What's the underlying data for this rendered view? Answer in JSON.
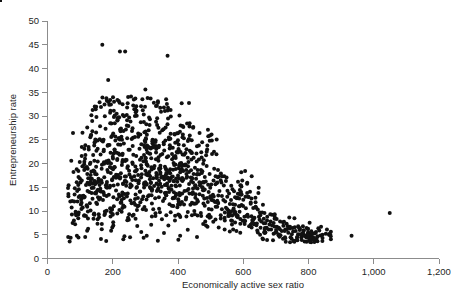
{
  "chart_data": {
    "type": "scatter",
    "title": "",
    "xlabel": "Economically active sex ratio",
    "ylabel": "Entrepreneurship rate",
    "xlim": [
      0,
      1200
    ],
    "ylim": [
      0,
      50
    ],
    "xticks": [
      0,
      200,
      400,
      600,
      800,
      1000,
      1200
    ],
    "xtick_labels": [
      "0",
      "200",
      "400",
      "600",
      "800",
      "1,000",
      "1,200"
    ],
    "yticks": [
      0,
      5,
      10,
      15,
      20,
      25,
      30,
      35,
      40,
      45,
      50
    ],
    "ytick_labels": [
      "0",
      "5",
      "10",
      "15",
      "20",
      "25",
      "30",
      "35",
      "40",
      "45",
      "50"
    ],
    "grid": false,
    "legend": false,
    "marker": "circle",
    "marker_color": "#111111",
    "marker_size": 2.0,
    "n_points": 1180,
    "outliers": [
      {
        "x": 168,
        "y": 45.0
      },
      {
        "x": 222,
        "y": 43.6
      },
      {
        "x": 238,
        "y": 43.6
      },
      {
        "x": 368,
        "y": 42.7
      },
      {
        "x": 186,
        "y": 37.6
      },
      {
        "x": 222,
        "y": 36.9
      },
      {
        "x": 300,
        "y": 35.6
      },
      {
        "x": 1049,
        "y": 9.6
      },
      {
        "x": 932,
        "y": 4.8
      },
      {
        "x": 597,
        "y": 16.4
      },
      {
        "x": 498,
        "y": 25.9
      }
    ],
    "points": [
      [
        64,
        13.6
      ],
      [
        70,
        12.0
      ],
      [
        77,
        7.5
      ],
      [
        82,
        12.0
      ],
      [
        92,
        12.0
      ],
      [
        96,
        14.6
      ],
      [
        101,
        16.0
      ],
      [
        104,
        10.4
      ],
      [
        107,
        19.4
      ],
      [
        110,
        13.2
      ],
      [
        112,
        9.0
      ],
      [
        115,
        21.0
      ],
      [
        118,
        15.5
      ],
      [
        120,
        11.2
      ],
      [
        122,
        17.8
      ],
      [
        124,
        8.4
      ],
      [
        126,
        23.5
      ],
      [
        128,
        14.0
      ],
      [
        130,
        19.9
      ],
      [
        132,
        10.1
      ],
      [
        134,
        26.0
      ],
      [
        136,
        16.8
      ],
      [
        138,
        12.6
      ],
      [
        140,
        21.8
      ],
      [
        142,
        9.3
      ],
      [
        144,
        18.3
      ],
      [
        146,
        24.6
      ],
      [
        148,
        13.9
      ],
      [
        150,
        29.8
      ],
      [
        152,
        11.5
      ],
      [
        154,
        20.4
      ],
      [
        156,
        16.2
      ],
      [
        158,
        8.7
      ],
      [
        160,
        25.1
      ],
      [
        162,
        14.7
      ],
      [
        164,
        31.9
      ],
      [
        166,
        18.9
      ],
      [
        168,
        45.0
      ],
      [
        170,
        12.3
      ],
      [
        172,
        22.6
      ],
      [
        174,
        17.1
      ],
      [
        176,
        9.9
      ],
      [
        178,
        27.3
      ],
      [
        180,
        15.0
      ],
      [
        182,
        33.2
      ],
      [
        184,
        20.1
      ],
      [
        186,
        37.6
      ],
      [
        188,
        13.4
      ],
      [
        190,
        23.9
      ],
      [
        192,
        10.6
      ],
      [
        194,
        18.0
      ],
      [
        196,
        28.4
      ],
      [
        198,
        16.5
      ],
      [
        200,
        21.4
      ],
      [
        202,
        12.9
      ],
      [
        204,
        33.0
      ],
      [
        206,
        19.2
      ],
      [
        208,
        25.7
      ],
      [
        210,
        14.3
      ],
      [
        212,
        30.5
      ],
      [
        214,
        9.5
      ],
      [
        216,
        17.6
      ],
      [
        218,
        22.1
      ],
      [
        220,
        13.0
      ],
      [
        222,
        43.6
      ],
      [
        224,
        26.8
      ],
      [
        226,
        11.8
      ],
      [
        228,
        19.7
      ],
      [
        230,
        32.5
      ],
      [
        232,
        15.8
      ],
      [
        234,
        24.2
      ],
      [
        236,
        10.9
      ],
      [
        238,
        43.6
      ],
      [
        240,
        20.8
      ],
      [
        242,
        16.1
      ],
      [
        244,
        29.1
      ],
      [
        246,
        13.7
      ],
      [
        248,
        27.9
      ],
      [
        250,
        18.5
      ],
      [
        252,
        22.9
      ],
      [
        254,
        12.2
      ],
      [
        256,
        34.1
      ],
      [
        258,
        15.3
      ],
      [
        260,
        20.2
      ],
      [
        262,
        25.4
      ],
      [
        264,
        9.2
      ],
      [
        266,
        17.3
      ],
      [
        268,
        30.0
      ],
      [
        270,
        13.5
      ],
      [
        272,
        21.6
      ],
      [
        274,
        18.7
      ],
      [
        276,
        11.0
      ],
      [
        278,
        26.3
      ],
      [
        280,
        16.4
      ],
      [
        282,
        23.1
      ],
      [
        284,
        14.1
      ],
      [
        286,
        28.7
      ],
      [
        288,
        19.0
      ],
      [
        290,
        12.5
      ],
      [
        292,
        31.2
      ],
      [
        294,
        20.5
      ],
      [
        296,
        15.6
      ],
      [
        298,
        24.8
      ],
      [
        300,
        35.6
      ],
      [
        302,
        10.2
      ],
      [
        304,
        17.9
      ],
      [
        306,
        22.3
      ],
      [
        308,
        13.1
      ],
      [
        310,
        27.0
      ],
      [
        312,
        18.2
      ],
      [
        314,
        29.3
      ],
      [
        316,
        14.8
      ],
      [
        318,
        21.1
      ],
      [
        320,
        11.6
      ],
      [
        322,
        25.0
      ],
      [
        324,
        16.9
      ],
      [
        326,
        32.8
      ],
      [
        328,
        19.5
      ],
      [
        330,
        12.7
      ],
      [
        332,
        23.7
      ],
      [
        334,
        17.4
      ],
      [
        336,
        28.1
      ],
      [
        338,
        14.4
      ],
      [
        340,
        20.6
      ],
      [
        342,
        10.5
      ],
      [
        344,
        26.5
      ],
      [
        346,
        18.1
      ],
      [
        348,
        30.9
      ],
      [
        350,
        15.1
      ],
      [
        352,
        22.0
      ],
      [
        354,
        12.1
      ],
      [
        356,
        24.4
      ],
      [
        358,
        16.7
      ],
      [
        360,
        19.3
      ],
      [
        362,
        27.6
      ],
      [
        364,
        13.3
      ],
      [
        366,
        21.3
      ],
      [
        368,
        42.7
      ],
      [
        370,
        17.0
      ],
      [
        372,
        25.5
      ],
      [
        374,
        11.4
      ],
      [
        376,
        18.8
      ],
      [
        378,
        29.9
      ],
      [
        380,
        14.5
      ],
      [
        382,
        20.9
      ],
      [
        384,
        23.3
      ],
      [
        386,
        16.3
      ],
      [
        388,
        12.8
      ],
      [
        390,
        26.1
      ],
      [
        392,
        19.8
      ],
      [
        394,
        15.2
      ],
      [
        396,
        22.4
      ],
      [
        398,
        10.8
      ],
      [
        400,
        17.5
      ],
      [
        402,
        24.0
      ],
      [
        404,
        13.8
      ],
      [
        406,
        20.0
      ],
      [
        408,
        28.0
      ],
      [
        410,
        16.6
      ],
      [
        412,
        11.9
      ],
      [
        414,
        21.9
      ],
      [
        416,
        18.4
      ],
      [
        418,
        25.3
      ],
      [
        420,
        14.2
      ],
      [
        422,
        19.6
      ],
      [
        424,
        12.4
      ],
      [
        426,
        23.0
      ],
      [
        428,
        17.2
      ],
      [
        430,
        9.8
      ],
      [
        432,
        20.3
      ],
      [
        434,
        15.7
      ],
      [
        436,
        22.7
      ],
      [
        438,
        11.3
      ],
      [
        440,
        18.6
      ],
      [
        442,
        24.9
      ],
      [
        444,
        13.6
      ],
      [
        446,
        16.0
      ],
      [
        448,
        21.2
      ],
      [
        450,
        10.0
      ],
      [
        452,
        19.1
      ],
      [
        455,
        14.9
      ],
      [
        458,
        17.7
      ],
      [
        461,
        12.0
      ],
      [
        464,
        23.8
      ],
      [
        467,
        15.4
      ],
      [
        470,
        9.6
      ],
      [
        473,
        18.0
      ],
      [
        476,
        13.2
      ],
      [
        479,
        20.7
      ],
      [
        482,
        11.1
      ],
      [
        485,
        16.2
      ],
      [
        488,
        22.5
      ],
      [
        491,
        8.9
      ],
      [
        494,
        14.0
      ],
      [
        497,
        17.8
      ],
      [
        498,
        25.9
      ],
      [
        503,
        10.3
      ],
      [
        507,
        13.4
      ],
      [
        511,
        18.9
      ],
      [
        515,
        8.2
      ],
      [
        519,
        15.9
      ],
      [
        523,
        11.7
      ],
      [
        527,
        14.2
      ],
      [
        531,
        9.1
      ],
      [
        535,
        17.3
      ],
      [
        539,
        12.3
      ],
      [
        543,
        8.6
      ],
      [
        547,
        10.7
      ],
      [
        551,
        13.0
      ],
      [
        555,
        9.4
      ],
      [
        559,
        11.5
      ],
      [
        563,
        8.0
      ],
      [
        567,
        14.6
      ],
      [
        571,
        10.1
      ],
      [
        575,
        7.6
      ],
      [
        579,
        12.8
      ],
      [
        583,
        9.0
      ],
      [
        587,
        11.0
      ],
      [
        591,
        8.3
      ],
      [
        595,
        13.5
      ],
      [
        597,
        16.4
      ],
      [
        603,
        7.9
      ],
      [
        608,
        10.6
      ],
      [
        613,
        9.2
      ],
      [
        618,
        6.8
      ],
      [
        623,
        11.8
      ],
      [
        628,
        8.1
      ],
      [
        633,
        7.2
      ],
      [
        638,
        10.9
      ],
      [
        643,
        5.9
      ],
      [
        648,
        8.8
      ],
      [
        653,
        6.5
      ],
      [
        658,
        9.7
      ],
      [
        663,
        7.4
      ],
      [
        668,
        5.5
      ],
      [
        673,
        8.0
      ],
      [
        678,
        6.1
      ],
      [
        683,
        9.3
      ],
      [
        688,
        7.0
      ],
      [
        693,
        5.2
      ],
      [
        698,
        8.5
      ],
      [
        703,
        6.7
      ],
      [
        708,
        4.9
      ],
      [
        713,
        7.8
      ],
      [
        718,
        5.8
      ],
      [
        723,
        6.9
      ],
      [
        728,
        4.5
      ],
      [
        733,
        7.3
      ],
      [
        738,
        5.4
      ],
      [
        743,
        6.3
      ],
      [
        748,
        4.2
      ],
      [
        753,
        5.7
      ],
      [
        758,
        6.6
      ],
      [
        763,
        3.9
      ],
      [
        768,
        5.1
      ],
      [
        773,
        6.0
      ],
      [
        778,
        4.4
      ],
      [
        783,
        5.3
      ],
      [
        788,
        3.6
      ],
      [
        793,
        4.8
      ],
      [
        798,
        6.2
      ],
      [
        803,
        3.8
      ],
      [
        808,
        5.0
      ],
      [
        813,
        4.1
      ],
      [
        818,
        3.5
      ],
      [
        823,
        5.6
      ],
      [
        828,
        4.7
      ],
      [
        833,
        5.9
      ],
      [
        843,
        4.3
      ],
      [
        853,
        5.2
      ],
      [
        863,
        5.0
      ],
      [
        932,
        4.8
      ],
      [
        1049,
        9.6
      ]
    ]
  },
  "axes": {
    "x_title": "Economically active sex ratio",
    "y_title": "Entrepreneurship rate"
  }
}
